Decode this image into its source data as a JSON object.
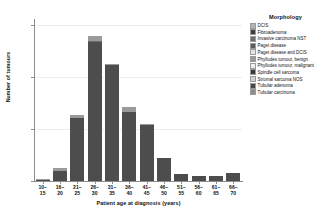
{
  "chart_data": {
    "type": "bar",
    "stacked": true,
    "title": "",
    "xlabel": "Patient age at diagnosis (years)",
    "ylabel": "Number of tumours",
    "categories": [
      "10–\n15",
      "16–\n20",
      "21–\n25",
      "26–\n30",
      "31–\n35",
      "36–\n40",
      "41–\n45",
      "46–\n50",
      "51–\n55",
      "56–\n60",
      "61–\n65",
      "66–\n70"
    ],
    "category_plain": [
      "10-15",
      "16-20",
      "21-25",
      "26-30",
      "31-35",
      "36-40",
      "41-45",
      "46-50",
      "51-55",
      "56-60",
      "61-65",
      "66-70"
    ],
    "ylim": [
      0,
      155
    ],
    "yticks": [
      0,
      50,
      100,
      150
    ],
    "ytick_labels": [
      "0",
      "50",
      "100",
      "150"
    ],
    "grid": "horizontal",
    "legend_position": "right",
    "legend_title": "Morphology",
    "totals": [
      2,
      13,
      64,
      140,
      113,
      71,
      55,
      22,
      7,
      5,
      5,
      8
    ],
    "series": [
      {
        "name": "DCIS",
        "color": "#b3b3b3",
        "values": [
          0,
          0,
          0,
          0,
          0,
          0,
          0,
          0,
          0,
          0,
          0,
          0
        ]
      },
      {
        "name": "Fibroadenoma",
        "color": "#4d4d4d",
        "values": [
          1,
          10,
          61,
          134,
          112,
          66,
          54,
          22,
          7,
          5,
          5,
          8
        ]
      },
      {
        "name": "Invasive carcinoma NST",
        "color": "#6e6e6e",
        "values": [
          0,
          0,
          0,
          1,
          0,
          0,
          0,
          0,
          0,
          0,
          0,
          0
        ]
      },
      {
        "name": "Paget disease",
        "color": "#595959",
        "values": [
          0,
          0,
          0,
          0,
          0,
          0,
          0,
          0,
          0,
          0,
          0,
          0
        ]
      },
      {
        "name": "Paget disease and DCIS",
        "color": "#e0e0e0",
        "values": [
          0,
          0,
          0,
          0,
          0,
          0,
          0,
          0,
          0,
          0,
          0,
          0
        ]
      },
      {
        "name": "Phyllodes tumour, benign",
        "color": "#9a9a9a",
        "values": [
          1,
          3,
          3,
          5,
          1,
          5,
          1,
          0,
          0,
          0,
          0,
          0
        ]
      },
      {
        "name": "Phyllodes tumour, malignant",
        "color": "#efefef",
        "values": [
          0,
          0,
          0,
          0,
          0,
          0,
          0,
          0,
          0,
          0,
          0,
          0
        ]
      },
      {
        "name": "Spindle cell sarcoma",
        "color": "#3d3d3d",
        "values": [
          0,
          0,
          0,
          0,
          0,
          0,
          0,
          0,
          0,
          0,
          0,
          0
        ]
      },
      {
        "name": "Stromal sarcoma NOS",
        "color": "#d6d6d6",
        "values": [
          0,
          0,
          0,
          0,
          0,
          0,
          0,
          0,
          0,
          0,
          0,
          0
        ]
      },
      {
        "name": "Tubular adenoma",
        "color": "#444444",
        "values": [
          0,
          0,
          0,
          0,
          0,
          0,
          0,
          0,
          0,
          0,
          0,
          0
        ]
      },
      {
        "name": "Tubular carcinoma",
        "color": "#8a8a8a",
        "values": [
          0,
          0,
          0,
          0,
          0,
          0,
          0,
          0,
          0,
          0,
          0,
          0
        ]
      }
    ]
  },
  "legend": {
    "title": "Morphology",
    "items": [
      {
        "label": "DCIS",
        "color": "#b3b3b3"
      },
      {
        "label": "Fibroadenoma",
        "color": "#3f3f3f"
      },
      {
        "label": "Invasive carcinoma NST",
        "color": "#6e6e6e"
      },
      {
        "label": "Paget disease",
        "color": "#5a5a5a"
      },
      {
        "label": "Paget disease and DCIS",
        "color": "#e4e4e4"
      },
      {
        "label": "Phyllodes tumour, benign",
        "color": "#9a9a9a"
      },
      {
        "label": "Phyllodes tumour, malignant",
        "color": "#f0f0f0"
      },
      {
        "label": "Spindle cell sarcoma",
        "color": "#3a3a3a"
      },
      {
        "label": "Stromal sarcoma NOS",
        "color": "#d2d2d2"
      },
      {
        "label": "Tubular adenoma",
        "color": "#464646"
      },
      {
        "label": "Tubular carcinoma",
        "color": "#8c8c8c"
      }
    ]
  }
}
